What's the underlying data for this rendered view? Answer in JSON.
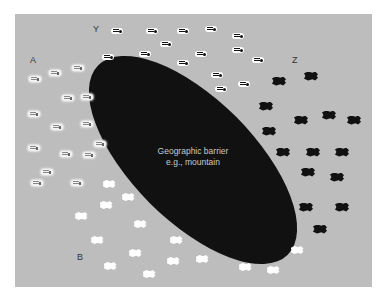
{
  "diagram": {
    "barrier_label_line1": "Geographic barrier",
    "barrier_label_line2": "e.g., mountain",
    "populations": {
      "A": {
        "label": "A",
        "x": 32,
        "y": 60
      },
      "Y": {
        "label": "Y",
        "x": 93,
        "y": 24
      },
      "Z": {
        "label": "Z",
        "x": 292,
        "y": 55
      },
      "B": {
        "label": "B",
        "x": 76,
        "y": 252
      }
    },
    "colors": {
      "background": "#bdbdbd",
      "barrier": "#111111",
      "barrier_text": "#c9c9c9"
    }
  }
}
